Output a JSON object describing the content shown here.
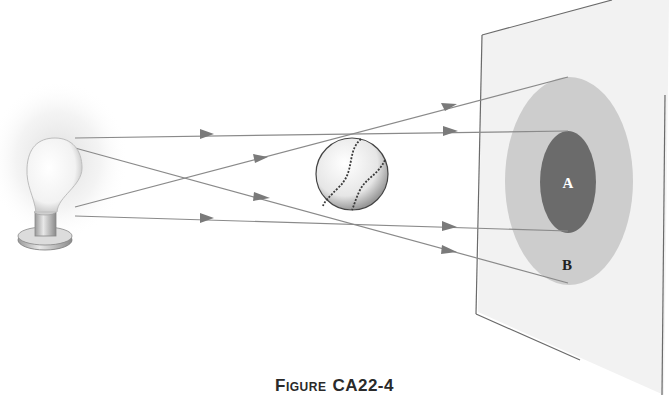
{
  "figure": {
    "caption_prefix": "Figure",
    "caption_number": "CA22-4",
    "labels": {
      "umbra": "A",
      "penumbra": "B"
    }
  },
  "colors": {
    "ray": "#8a8a8a",
    "arrow": "#7a7a7a",
    "screen_fill": "#f2f2f2",
    "screen_edge": "#6a6a6a",
    "umbra": "#6b6b6b",
    "penumbra": "#cdcdcd",
    "glow": "#e4e4e4"
  },
  "objects": [
    "light-bulb",
    "baseball",
    "screen"
  ]
}
